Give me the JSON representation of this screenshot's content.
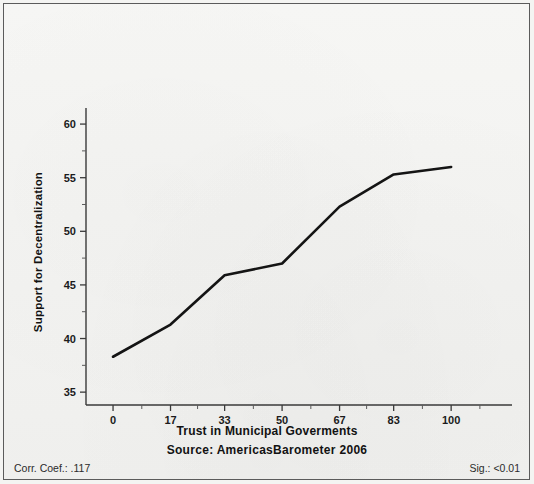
{
  "figure": {
    "ylabel": "Support for Decentralization",
    "xlabel": "Trust in Municipal Goverments",
    "source": "Source: AmericasBarometer 2006",
    "corr_label": "Corr. Coef.: .117",
    "sig_label": "Sig.: <0.01",
    "line_color": "#141414",
    "axis_color": "#3a3a3a",
    "background_color": "#f4f4f2"
  },
  "chart_data": {
    "type": "line",
    "title": "",
    "subtitle": "",
    "xlabel": "Trust in Municipal Goverments",
    "ylabel": "Support for Decentralization",
    "x": [
      0,
      17,
      33,
      50,
      67,
      83,
      100
    ],
    "values": [
      38.3,
      41.3,
      45.9,
      47.0,
      52.3,
      55.3,
      56.0
    ],
    "series": [
      {
        "name": "Support for Decentralization",
        "values": [
          38.3,
          41.3,
          45.9,
          47.0,
          52.3,
          55.3,
          56.0
        ]
      }
    ],
    "xticks": [
      0,
      17,
      33,
      50,
      67,
      83,
      100
    ],
    "xticklabels": [
      "0",
      "17",
      "33",
      "50",
      "67",
      "83",
      "100"
    ],
    "yticks": [
      35,
      40,
      45,
      50,
      55,
      60
    ],
    "yticklabels": [
      "35",
      "40",
      "45",
      "50",
      "55",
      "60"
    ],
    "y_minor_ticks": [
      37.5,
      42.5,
      47.5,
      52.5,
      57.5
    ],
    "xlim": [
      -8,
      118
    ],
    "ylim": [
      33.8,
      61.5
    ],
    "grid": false,
    "legend": null,
    "annotations": [
      "Corr. Coef.: .117",
      "Sig.: <0.01",
      "Source: AmericasBarometer 2006"
    ]
  }
}
